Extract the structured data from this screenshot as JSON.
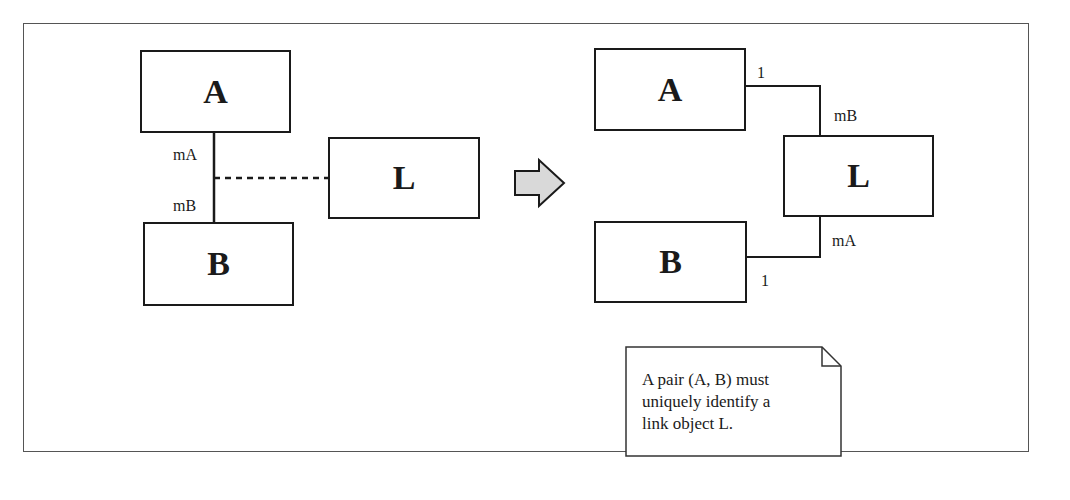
{
  "diagram": {
    "before": {
      "boxes": {
        "a": "A",
        "b": "B",
        "l": "L"
      },
      "multiplicities": {
        "near_a": "mA",
        "near_b": "mB"
      },
      "association_class_link": "dashed"
    },
    "transform_arrow": "right-arrow",
    "after": {
      "boxes": {
        "a": "A",
        "b": "B",
        "l": "L"
      },
      "multiplicities": {
        "a_end": "1",
        "l_end_from_a": "mB",
        "l_end_from_b": "mA",
        "b_end": "1"
      }
    },
    "note": "A pair (A, B) must\nuniquely identify a\nlink object L."
  },
  "colors": {
    "stroke": "#1a1a1a",
    "arrow_fill": "#d9d9d9",
    "frame": "#555555"
  }
}
